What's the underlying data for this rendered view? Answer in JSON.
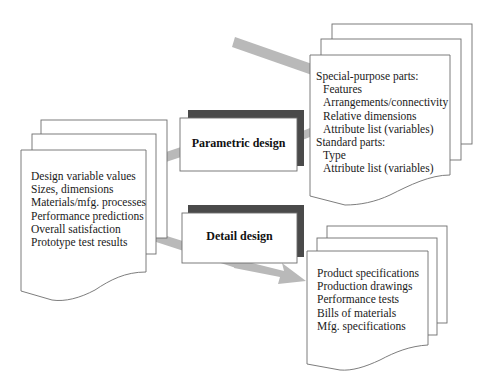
{
  "diagram": {
    "title": "",
    "colors": {
      "page_stroke": "#6e6e6e",
      "arrow_fill": "#b9b9b9",
      "box_shadow": "#4a4a4a"
    },
    "inputs_document": {
      "lines": [
        "Design variable values",
        "Sizes, dimensions",
        "Materials/mfg. processes",
        "Performance predictions",
        "Overall satisfaction",
        "Prototype test results"
      ]
    },
    "process_boxes": [
      {
        "id": "parametric",
        "label": "Parametric design"
      },
      {
        "id": "detail",
        "label": "Detail design"
      }
    ],
    "parts_document": {
      "special_heading": "Special-purpose parts:",
      "special_items": [
        "Features",
        "Arrangements/connectivity",
        "Relative dimensions",
        "Attribute list (variables)"
      ],
      "standard_heading": "Standard parts:",
      "standard_items": [
        "Type",
        "Attribute list (variables)"
      ]
    },
    "outputs_document": {
      "lines": [
        "Product specifications",
        "Production drawings",
        "Performance tests",
        "Bills of materials",
        "Mfg. specifications"
      ]
    },
    "connections": [
      {
        "from": "inputs_document",
        "to": "parametric",
        "type": "line"
      },
      {
        "from": "parametric",
        "to": "parts_document",
        "type": "line"
      },
      {
        "from": "parts_document",
        "to": "parametric",
        "type": "line"
      },
      {
        "from": "inputs_document",
        "to": "detail",
        "type": "line"
      },
      {
        "from": "detail",
        "to": "outputs_document",
        "type": "arrow"
      }
    ]
  }
}
